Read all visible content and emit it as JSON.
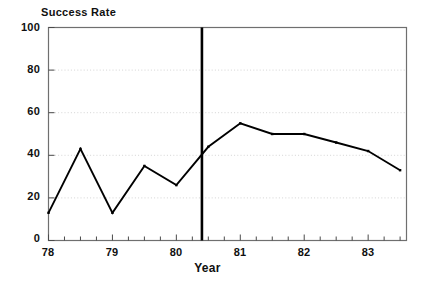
{
  "chart_data": {
    "type": "line",
    "title": "",
    "ylabel": "Success Rate",
    "xlabel": "Year",
    "xlim": [
      78.0,
      83.6
    ],
    "ylim": [
      0,
      100
    ],
    "grid": true,
    "legend": null,
    "y_ticks": [
      0,
      20,
      40,
      60,
      80,
      100
    ],
    "y_tick_labels": [
      "0",
      "20",
      "40",
      "60",
      "80",
      "100"
    ],
    "x_ticks": [
      78,
      79,
      80,
      81,
      82,
      83
    ],
    "x_tick_labels": [
      "78",
      "79",
      "80",
      "81",
      "82",
      "83"
    ],
    "x_minor_tick_interval": 0.25,
    "series": [
      {
        "name": "Success Rate",
        "color": "#000000",
        "x": [
          78.0,
          78.5,
          79.0,
          79.5,
          80.0,
          80.5,
          81.0,
          81.5,
          82.0,
          82.5,
          83.0,
          83.5
        ],
        "values": [
          13,
          43,
          13,
          35,
          26,
          44,
          55,
          50,
          50,
          46,
          42,
          33
        ]
      }
    ],
    "annotations": [
      {
        "name": "intervention-line",
        "type": "vline",
        "x": 80.4,
        "color": "#000000"
      }
    ]
  },
  "axis_labels": {
    "y_title": "Success Rate",
    "x_title": "Year"
  }
}
